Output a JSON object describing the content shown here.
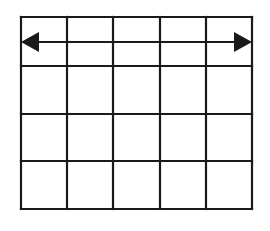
{
  "diagram": {
    "type": "grid-with-double-arrow",
    "background": "#ffffff",
    "line_color": "#1a1a1a",
    "grid": {
      "columns": 5,
      "rows": 4,
      "x_lines": [
        21,
        67,
        113,
        160,
        206,
        252
      ],
      "y_lines": [
        17,
        66,
        114,
        161,
        209
      ],
      "stroke_width": 2.2
    },
    "arrow": {
      "description": "double-headed horizontal arrow spanning the full grid width",
      "y": 42,
      "x_start": 21,
      "x_end": 252,
      "head_left": "left-pointing filled triangle",
      "head_right": "right-pointing filled triangle",
      "head_length": 18,
      "head_half_height": 10
    }
  }
}
